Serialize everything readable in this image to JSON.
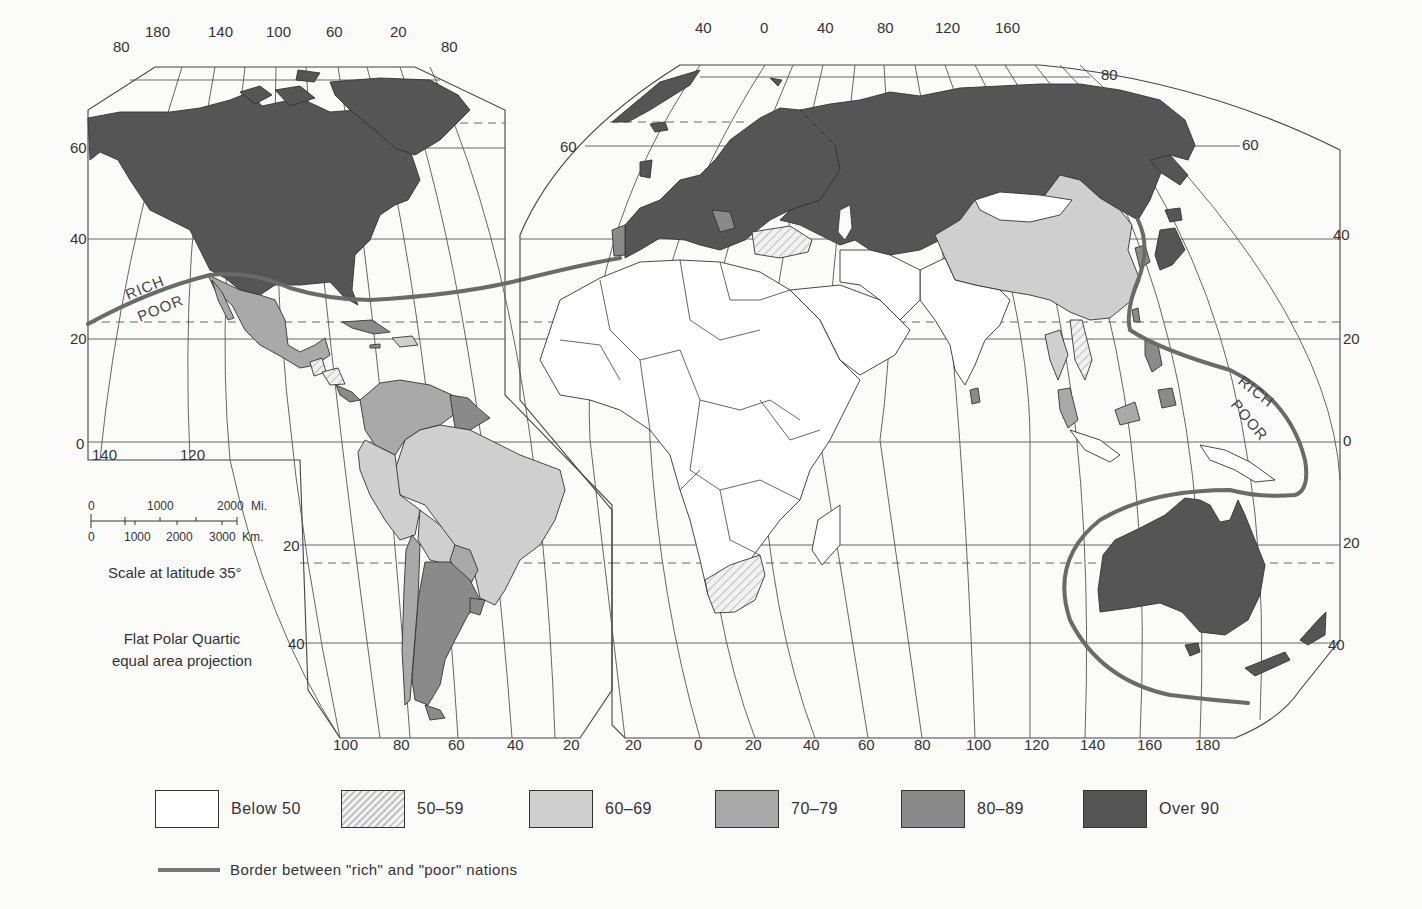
{
  "map": {
    "projection_note_line1": "Flat Polar Quartic",
    "projection_note_line2": "equal area projection",
    "scale": {
      "miles_ticks": [
        "0",
        "1000",
        "2000"
      ],
      "miles_unit": "Mi.",
      "km_ticks": [
        "0",
        "1000",
        "2000",
        "3000"
      ],
      "km_unit": "Km.",
      "caption": "Scale at latitude 35°"
    },
    "boundary_labels": {
      "americas_rich": "RICH",
      "americas_poor": "POOR",
      "pacific_rich": "RICH",
      "pacific_poor": "POOR"
    },
    "left_panel": {
      "top_longitudes": [
        "180",
        "140",
        "100",
        "60",
        "20"
      ],
      "bottom_longitudes": [
        "100",
        "80",
        "60",
        "40",
        "20"
      ],
      "inner_bottom_longitudes": [
        "140",
        "120"
      ],
      "left_latitudes": [
        "80",
        "60",
        "40",
        "20",
        "0",
        "20",
        "40"
      ],
      "right_top_latitude": "80"
    },
    "right_panel": {
      "top_longitudes": [
        "40",
        "0",
        "40",
        "80",
        "120",
        "160"
      ],
      "bottom_longitudes": [
        "20",
        "0",
        "20",
        "40",
        "60",
        "80",
        "100",
        "120",
        "140",
        "160",
        "180"
      ],
      "left_latitudes": [
        "60"
      ],
      "right_latitudes": [
        "80",
        "60",
        "40",
        "20",
        "0",
        "20",
        "40"
      ]
    }
  },
  "legend": {
    "items": [
      {
        "label": "Below 50",
        "fill": "#ffffff",
        "pattern": "none"
      },
      {
        "label": "50–59",
        "fill": "#efefef",
        "pattern": "hatch"
      },
      {
        "label": "60–69",
        "fill": "#cfcfcf",
        "pattern": "none"
      },
      {
        "label": "70–79",
        "fill": "#a9a9a9",
        "pattern": "none"
      },
      {
        "label": "80–89",
        "fill": "#8a8a8a",
        "pattern": "none"
      },
      {
        "label": "Over 90",
        "fill": "#555555",
        "pattern": "none"
      }
    ],
    "border_label": "Border between \"rich\" and \"poor\" nations"
  },
  "colors": {
    "background": "#fbfbfa",
    "over90": "#555555",
    "c80_89": "#8a8a8a",
    "c70_79": "#a9a9a9",
    "c60_69": "#cfcfcf",
    "c50_59": "#efefef",
    "below50": "#ffffff",
    "rich_poor_line": "#6a6a6a"
  }
}
